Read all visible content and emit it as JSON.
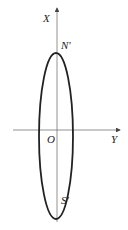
{
  "diagram": {
    "axes": {
      "vertical_label": "X",
      "horizontal_label": "Y",
      "origin_label": "O"
    },
    "points": {
      "top": "N'",
      "bottom": "S'"
    },
    "shape": "ellipse"
  }
}
